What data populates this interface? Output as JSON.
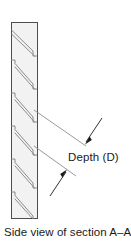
{
  "figure": {
    "caption": "Side view of section A–A",
    "annotations": {
      "depth_label": "Depth (D)"
    },
    "colors": {
      "outline": "#4d4d4d",
      "plate_fill": "#f2f2f2",
      "slot_edge": "#808080",
      "leader_line": "#808080",
      "arrow": "#1a1a1a",
      "text": "#1a1a1a",
      "background": "#ffffff"
    },
    "geometry": {
      "plate": {
        "left_x": 11,
        "right_x": 38,
        "top_y": 22,
        "bottom_y": 219,
        "width": 27,
        "height": 197
      },
      "slot_count": 6,
      "slot_pitch": 33,
      "slot_first_top_y": 30,
      "slot_angle_deg": 35
    },
    "leaders": [
      {
        "name": "upper-leader",
        "from_x": 38,
        "from_y": 112,
        "to_x": 84,
        "to_y": 142,
        "arrow_from_x": 102,
        "arrow_from_y": 120,
        "arrow_to_x": 85,
        "arrow_to_y": 143
      },
      {
        "name": "lower-leader",
        "from_x": 38,
        "from_y": 148,
        "to_x": 74,
        "to_y": 172,
        "arrow_from_x": 50,
        "arrow_from_y": 194,
        "arrow_to_x": 66,
        "arrow_to_y": 170
      }
    ]
  }
}
